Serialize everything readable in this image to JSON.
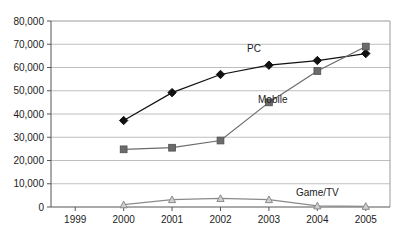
{
  "chart_data": {
    "type": "line",
    "title": "",
    "xlabel": "",
    "ylabel": "",
    "categories": [
      "1999",
      "2000",
      "2001",
      "2002",
      "2003",
      "2004",
      "2005"
    ],
    "ylim": [
      0,
      80000
    ],
    "ytick_labels": [
      "0",
      "10,000",
      "20,000",
      "30,000",
      "40,000",
      "50,000",
      "60,000",
      "70,000",
      "80,000"
    ],
    "ytick_values": [
      0,
      10000,
      20000,
      30000,
      40000,
      50000,
      60000,
      70000,
      80000
    ],
    "grid": true,
    "legend_position": "inline-annotations",
    "series": [
      {
        "name": "PC",
        "marker": "diamond",
        "color": "#111111",
        "x": [
          "2000",
          "2001",
          "2002",
          "2003",
          "2004",
          "2005"
        ],
        "values": [
          37200,
          49200,
          57000,
          61000,
          63000,
          66000
        ]
      },
      {
        "name": "Mobile",
        "marker": "square",
        "color": "#6b6b6b",
        "x": [
          "2000",
          "2001",
          "2002",
          "2003",
          "2004",
          "2005"
        ],
        "values": [
          24800,
          25500,
          28600,
          45000,
          58500,
          69000
        ]
      },
      {
        "name": "Game/TV",
        "marker": "triangle",
        "color": "#8a8a8a",
        "x": [
          "2000",
          "2001",
          "2002",
          "2003",
          "2004",
          "2005"
        ],
        "values": [
          1000,
          3200,
          3700,
          3200,
          500,
          300
        ]
      }
    ],
    "annotations": [
      {
        "text": "PC",
        "x_px": 247,
        "y_px": 52
      },
      {
        "text": "Mobile",
        "x_px": 258,
        "y_px": 103
      },
      {
        "text": "Game/TV",
        "x_px": 296,
        "y_px": 196
      }
    ]
  }
}
